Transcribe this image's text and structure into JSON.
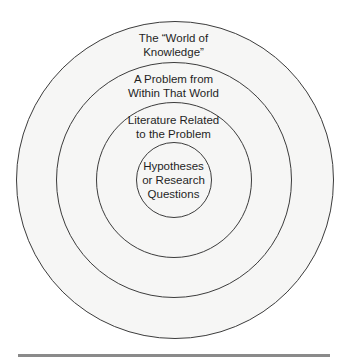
{
  "diagram": {
    "type": "concentric-circles",
    "center": {
      "x": 174,
      "y": 180
    },
    "rings": [
      {
        "name": "world-of-knowledge",
        "radius": 159,
        "label_lines": [
          "The “World of",
          "Knowledge”"
        ]
      },
      {
        "name": "problem-within-world",
        "radius": 118,
        "label_lines": [
          "A Problem from",
          "Within That World"
        ]
      },
      {
        "name": "related-literature",
        "radius": 78,
        "label_lines": [
          "Literature Related",
          "to the Problem"
        ]
      },
      {
        "name": "hypotheses-research-questions",
        "radius": 38,
        "label_lines": [
          "Hypotheses",
          "or Research",
          "Questions"
        ]
      }
    ],
    "colors": {
      "stroke": "#3c3c3c",
      "fill": "#f6f6f5",
      "text": "#1f1f1f",
      "rule": "#8a8a8a"
    }
  }
}
